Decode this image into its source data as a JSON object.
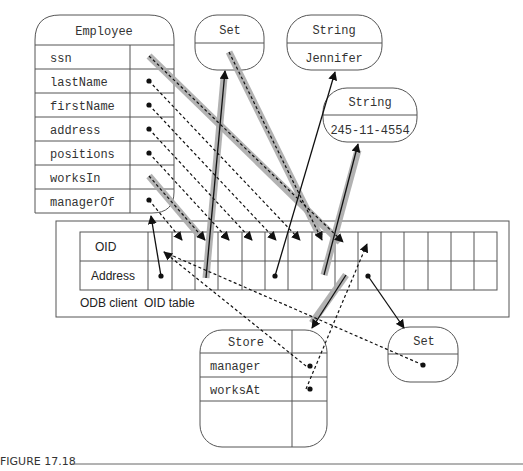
{
  "figure": {
    "caption": "FIGURE 17.18"
  },
  "employee": {
    "title": "Employee",
    "fields": [
      "ssn",
      "lastName",
      "firstName",
      "address",
      "positions",
      "worksIn",
      "managerOf"
    ]
  },
  "set_top": {
    "title": "Set",
    "value": ""
  },
  "string_name": {
    "title": "String",
    "value": "Jennifer"
  },
  "string_ssn": {
    "title": "String",
    "value": "245-11-4554"
  },
  "oid_table": {
    "row_labels": [
      "OID",
      "Address"
    ],
    "label": "ODB client  OID table",
    "columns": 15
  },
  "store": {
    "title": "Store",
    "fields": [
      "manager",
      "worksAt",
      ""
    ]
  },
  "set_bottom": {
    "title": "Set",
    "value": ""
  }
}
